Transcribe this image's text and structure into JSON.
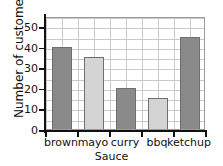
{
  "heading": {
    "text": "...answers are shown on the bar chart."
  },
  "chart_data": {
    "type": "bar",
    "title": "",
    "xlabel": "Sauce",
    "ylabel": "Number of customers",
    "categories": [
      "brown",
      "mayo",
      "curry",
      "bbq",
      "ketchup"
    ],
    "values": [
      40,
      35,
      20,
      15,
      45
    ],
    "ylim": [
      0,
      55
    ],
    "ytick_labels": [
      "0",
      "10",
      "20",
      "30",
      "40",
      "50"
    ],
    "ytick_values": [
      0,
      10,
      20,
      30,
      40,
      50
    ],
    "y_major_step": 10,
    "y_minor_step": 5,
    "grid": true,
    "legend": "none",
    "bar_colors": [
      "#8a8a8a",
      "#d4d4d4",
      "#8a8a8a",
      "#d4d4d4",
      "#8a8a8a"
    ],
    "bar_edge_color": "#6f6f6f",
    "grid_color": "#c9c9c9",
    "axis_color": "#111111",
    "plot_background": "#ffffff"
  }
}
